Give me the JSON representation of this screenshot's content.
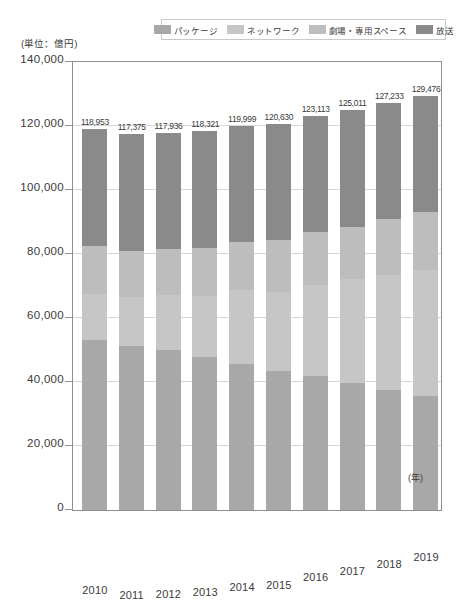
{
  "unit_note": "(単位：億円)",
  "legend": {
    "items": [
      {
        "label": "パッケージ",
        "color": "#a8a8a8"
      },
      {
        "label": "ネットワーク",
        "color": "#c6c6c6"
      },
      {
        "label": "劇場・専用スペース",
        "color": "#bdbdbd"
      },
      {
        "label": "放送",
        "color": "#8a8a8a"
      }
    ]
  },
  "axis": {
    "x_unit": "(年)",
    "y_ticks": [
      "140,000",
      "120,000",
      "100,000",
      "80,000",
      "60,000",
      "40,000",
      "20,000",
      "0"
    ]
  },
  "chart_data": {
    "type": "bar",
    "title": "",
    "xlabel": "(年)",
    "ylabel": "(単位：億円)",
    "ylim": [
      0,
      140000
    ],
    "ytick_step": 20000,
    "grid": true,
    "stacked": true,
    "legend_position": "top",
    "categories": [
      "2010",
      "2011",
      "2012",
      "2013",
      "2014",
      "2015",
      "2016",
      "2017",
      "2018",
      "2019"
    ],
    "series": [
      {
        "name": "パッケージ",
        "color": "#a8a8a8",
        "values": [
          53022,
          51103,
          50108,
          47826,
          45525,
          43423,
          41826,
          39599,
          37385,
          35616
        ],
        "labels": [
          "53,022",
          "51,103",
          "50,108",
          "47,826",
          "45,525",
          "43,423",
          "41,826",
          "39,599",
          "37,385",
          "35,616"
        ]
      },
      {
        "name": "ネットワーク",
        "color": "#c6c6c6",
        "values": [
          14489,
          15393,
          16988,
          19079,
          23098,
          24724,
          28479,
          32458,
          36086,
          39291
        ],
        "labels": [
          "14,489",
          "15,393",
          "16,988",
          "19,079",
          "23,098",
          "24,724",
          "28,479",
          "32,458",
          "36,086",
          "39,291"
        ]
      },
      {
        "name": "劇場・専用スペース",
        "color": "#bdbdbd",
        "values": [
          15046,
          14319,
          14552,
          14883,
          15224,
          16108,
          16423,
          16506,
          17372,
          18156
        ],
        "labels": [
          "15,046",
          "14,319",
          "14,552",
          "14,883",
          "15,224",
          "16,108",
          "16,423",
          "16,506",
          "17,372",
          "18,156"
        ]
      },
      {
        "name": "放送",
        "color": "#8a8a8a",
        "values": [
          36396,
          36560,
          36288,
          36533,
          36152,
          36375,
          36385,
          36448,
          36390,
          36413
        ],
        "labels": [
          "36,396",
          "36,560",
          "36,288",
          "36,533",
          "36,152",
          "36,375",
          "36,385",
          "36,448",
          "36,390",
          "36,413"
        ]
      }
    ],
    "totals": [
      118953,
      117375,
      117936,
      118321,
      119999,
      120630,
      123113,
      125011,
      127233,
      129476
    ],
    "total_labels": [
      "118,953",
      "117,375",
      "117,936",
      "118,321",
      "119,999",
      "120,630",
      "123,113",
      "125,011",
      "127,233",
      "129,476"
    ]
  }
}
